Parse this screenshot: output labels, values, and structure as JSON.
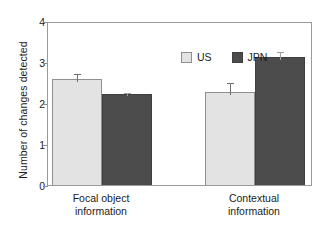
{
  "chart_data": {
    "type": "bar",
    "title": "",
    "subtitle": "",
    "xlabel": "",
    "ylabel": "Number of changes detected",
    "categories": [
      "Focal object information",
      "Contextual information"
    ],
    "category_lines": [
      [
        "Focal object",
        "information"
      ],
      [
        "Contextual",
        "information"
      ]
    ],
    "series": [
      {
        "name": "US",
        "color": "#e3e3e3",
        "edge_color": "#8f8f8f",
        "values": [
          2.58,
          2.27
        ],
        "errors": [
          0.18,
          0.27
        ]
      },
      {
        "name": "JPN",
        "color": "#4c4c4c",
        "edge_color": "#3f3f3f",
        "values": [
          2.22,
          3.12
        ],
        "errors": [
          0.08,
          0.18
        ]
      }
    ],
    "ylim": [
      0,
      4
    ],
    "yticks": [
      0,
      1,
      2,
      3,
      4
    ],
    "ytick_labels": [
      "0",
      "1",
      "2",
      "3",
      "4"
    ],
    "grid": false,
    "legend_position": "top-center-inside",
    "error_bar_type": "standard error"
  },
  "legend": {
    "items": [
      {
        "label": "US",
        "swatch": "light-gray-swatch"
      },
      {
        "label": "JPN",
        "swatch": "dark-gray-swatch"
      }
    ]
  }
}
